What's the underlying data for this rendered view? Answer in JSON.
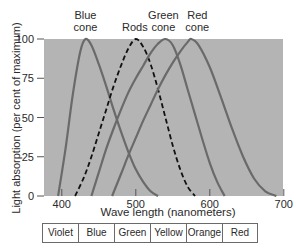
{
  "chart_data": {
    "type": "line",
    "title": "",
    "xlabel": "Wave length (nanometers)",
    "ylabel": "Light absorption (per cent of maximum)",
    "xlim": [
      380,
      700
    ],
    "ylim": [
      0,
      100
    ],
    "x_ticks": [
      400,
      500,
      600,
      700
    ],
    "y_ticks": [
      0,
      25,
      50,
      75,
      100
    ],
    "grid": false,
    "background": "#b4b4b4",
    "series": [
      {
        "name": "Blue cone",
        "label_lines": [
          "Blue",
          "cone"
        ],
        "style": "solid",
        "peak_nm": 432,
        "x": [
          395,
          405,
          415,
          425,
          432,
          440,
          450,
          460,
          470,
          480,
          490,
          500,
          510,
          520,
          530
        ],
        "y": [
          0,
          30,
          65,
          92,
          100,
          96,
          84,
          70,
          55,
          41,
          28,
          17,
          9,
          3,
          0
        ]
      },
      {
        "name": "Rods",
        "label_lines": [
          "Rods"
        ],
        "style": "dashed",
        "peak_nm": 500,
        "x": [
          418,
          430,
          440,
          450,
          460,
          470,
          480,
          490,
          500,
          510,
          520,
          530,
          540,
          550,
          560,
          570,
          580
        ],
        "y": [
          0,
          12,
          25,
          40,
          55,
          70,
          83,
          94,
          100,
          95,
          84,
          68,
          50,
          32,
          17,
          6,
          0
        ]
      },
      {
        "name": "Green cone",
        "label_lines": [
          "Green",
          "cone"
        ],
        "style": "solid",
        "peak_nm": 540,
        "x": [
          440,
          450,
          460,
          470,
          480,
          490,
          500,
          510,
          520,
          530,
          540,
          550,
          560,
          570,
          580,
          590,
          600,
          610,
          620
        ],
        "y": [
          0,
          15,
          30,
          43,
          55,
          66,
          75,
          83,
          91,
          97,
          100,
          96,
          84,
          68,
          52,
          36,
          21,
          9,
          0
        ]
      },
      {
        "name": "Red cone",
        "label_lines": [
          "Red",
          "cone"
        ],
        "style": "solid",
        "peak_nm": 575,
        "x": [
          468,
          480,
          490,
          500,
          510,
          520,
          530,
          540,
          550,
          560,
          570,
          575,
          585,
          600,
          615,
          630,
          645,
          660,
          675,
          690
        ],
        "y": [
          0,
          14,
          26,
          37,
          48,
          58,
          68,
          77,
          85,
          92,
          98,
          100,
          96,
          82,
          63,
          43,
          25,
          11,
          3,
          0
        ]
      }
    ],
    "color_bands": [
      "Violet",
      "Blue",
      "Green",
      "Yellow",
      "Orange",
      "Red"
    ]
  }
}
